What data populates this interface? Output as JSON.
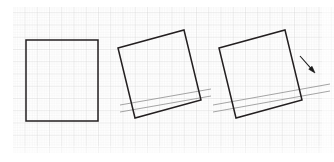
{
  "figure": {
    "title": "Square rotation sequence on graph paper",
    "canvas": {
      "width": 334,
      "height": 162,
      "background": "#ffffff"
    },
    "grid": {
      "name": "graph-paper-grid",
      "minor_spacing_px": 2.45,
      "major_spacing_px": 12.25,
      "minor_color": "#e3e3e3",
      "major_color": "#cfcfcf",
      "minor_width": 0.4,
      "major_width": 0.6,
      "area": {
        "x": 13,
        "y": 7,
        "width": 321,
        "height": 146
      },
      "visible": true
    },
    "stroke_colors": {
      "square_outline": "#231f20",
      "guide_line": "#9a9a9a",
      "arrow": "#1a1a1a"
    },
    "stroke_widths": {
      "square_outline": 1.5,
      "guide_line": 0.9,
      "arrow": 1.1
    },
    "shapes": [
      {
        "name": "square-stage-1-unrotated",
        "label": "Stage 1 — square at 0°",
        "rotation_deg": 0,
        "points": "26,40 98,40 98,121 26,121",
        "closed": true
      },
      {
        "name": "square-stage-2-rotated",
        "label": "Stage 2 — square rotated",
        "rotation_deg": -15,
        "points": "118,48 184,30 201,100 135,118",
        "closed": true
      },
      {
        "name": "square-stage-3-rotated",
        "label": "Stage 3 — square rotated with direction arrow",
        "rotation_deg": -15,
        "points": "219,48 285,30 302,100 236,118",
        "closed": true
      }
    ],
    "guide_lines": [
      {
        "name": "guide-line-stage-2-upper",
        "x1": 120,
        "y1": 105,
        "x2": 211,
        "y2": 89
      },
      {
        "name": "guide-line-stage-2-lower",
        "x1": 120,
        "y1": 112,
        "x2": 211,
        "y2": 96
      },
      {
        "name": "guide-line-stage-3-upper",
        "x1": 213,
        "y1": 105,
        "x2": 330,
        "y2": 84
      },
      {
        "name": "guide-line-stage-3-lower",
        "x1": 213,
        "y1": 112,
        "x2": 330,
        "y2": 91
      }
    ],
    "arrows": [
      {
        "name": "rotation-direction-arrow",
        "label": "direction of motion arrow",
        "x1": 300,
        "y1": 56,
        "x2": 315,
        "y2": 73,
        "head_length": 7,
        "head_width": 4.4
      }
    ]
  }
}
